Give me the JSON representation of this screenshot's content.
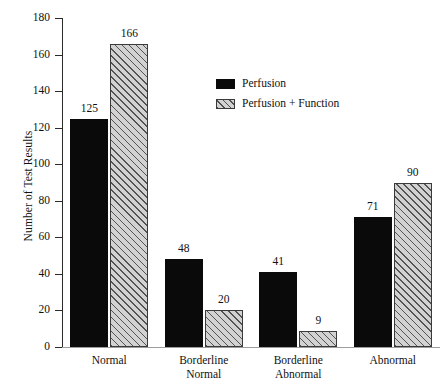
{
  "chart_data": {
    "type": "bar",
    "title": "",
    "subtitle": "",
    "xlabel": "",
    "ylabel": "Number of Test Results",
    "ylim": [
      0,
      180
    ],
    "ytick_step": 20,
    "yticks": [
      0,
      20,
      40,
      60,
      80,
      100,
      120,
      140,
      160,
      180
    ],
    "ytick_labels": [
      "0",
      "20",
      "40",
      "60",
      "80",
      "100",
      "120",
      "140",
      "160",
      "180"
    ],
    "grid": false,
    "legend_position": "upper-center-right",
    "categories": [
      "Normal",
      "Borderline\nNormal",
      "Borderline\nAbnormal",
      "Abnormal"
    ],
    "category_lines": [
      [
        "Normal"
      ],
      [
        "Borderline",
        "Normal"
      ],
      [
        "Borderline",
        "Abnormal"
      ],
      [
        "Abnormal"
      ]
    ],
    "series": [
      {
        "name": "Perfusion",
        "fill": "solid-black",
        "color": "#0a0a0a",
        "values": [
          125,
          48,
          41,
          71
        ],
        "value_labels": [
          "125",
          "48",
          "41",
          "71"
        ]
      },
      {
        "name": "Perfusion + Function",
        "fill": "diagonal-hatch",
        "color": "#d2d2d2",
        "values": [
          166,
          20,
          9,
          90
        ],
        "value_labels": [
          "166",
          "20",
          "9",
          "90"
        ]
      }
    ]
  },
  "legend": {
    "items": [
      {
        "label": "Perfusion",
        "swatch": "solid"
      },
      {
        "label": "Perfusion + Function",
        "swatch": "hatched"
      }
    ]
  },
  "colors": {
    "series_1": "#0a0a0a",
    "series_2_fill": "#d2d2d2",
    "series_2_hatch": "#3a3a3a",
    "axis": "#2b2b2b",
    "baseline": "#9d9d9d",
    "text": "#111111",
    "background": "#ffffff"
  }
}
